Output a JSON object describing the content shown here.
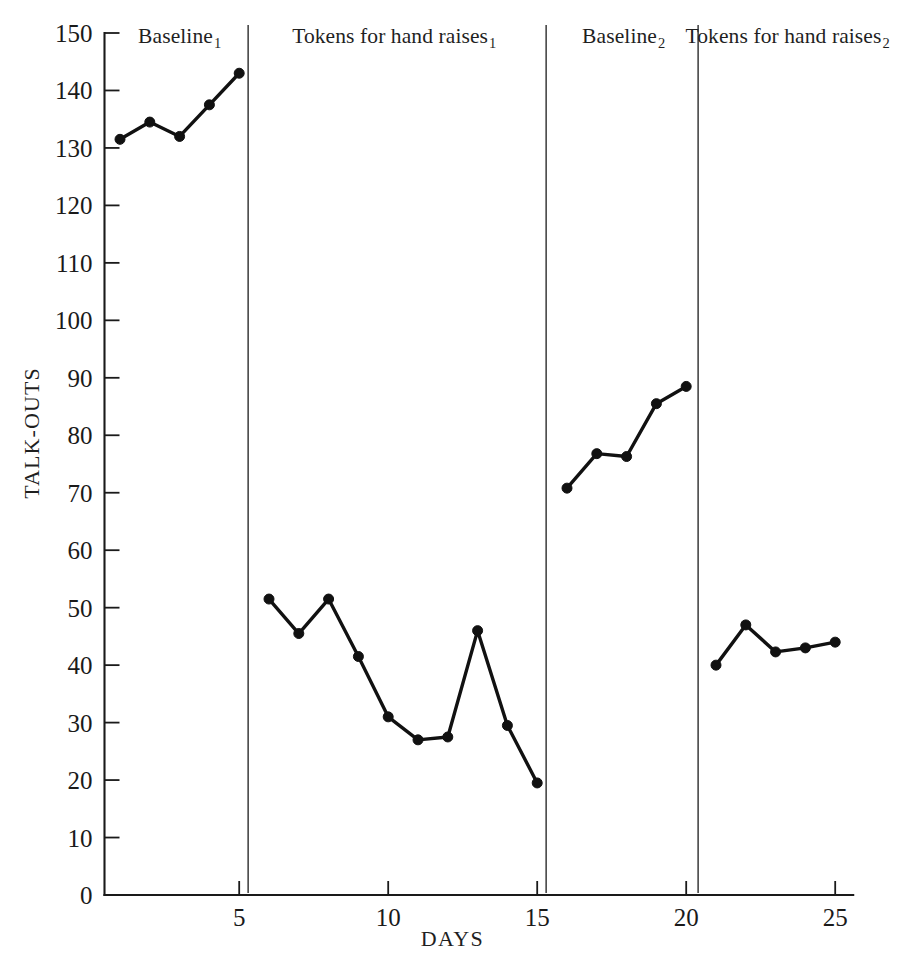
{
  "chart_data": {
    "type": "line",
    "title": "",
    "xlabel": "DAYS",
    "ylabel": "TALK-OUTS",
    "xlim": [
      0.3,
      25.8
    ],
    "ylim": [
      0,
      150
    ],
    "grid": false,
    "legend": "none",
    "y_ticks": [
      0,
      10,
      20,
      30,
      40,
      50,
      60,
      70,
      80,
      90,
      100,
      110,
      120,
      130,
      140,
      150
    ],
    "x_ticks": [
      5,
      10,
      15,
      20,
      25
    ],
    "x": [
      1,
      2,
      3,
      4,
      5,
      6,
      7,
      8,
      9,
      10,
      11,
      12,
      13,
      14,
      15,
      16,
      17,
      18,
      19,
      20,
      21,
      22,
      23,
      24,
      25
    ],
    "series": [
      {
        "name": "Baseline 1",
        "x": [
          1,
          2,
          3,
          4,
          5
        ],
        "values": [
          131.5,
          134.5,
          132.0,
          137.5,
          143.0
        ]
      },
      {
        "name": "Tokens for hand raises 1",
        "x": [
          6,
          7,
          8,
          9,
          10,
          11,
          12,
          13,
          14,
          15
        ],
        "values": [
          51.5,
          45.5,
          51.5,
          41.5,
          31.0,
          27.0,
          27.5,
          46.0,
          29.5,
          19.5
        ]
      },
      {
        "name": "Baseline 2",
        "x": [
          16,
          17,
          18,
          19,
          20
        ],
        "values": [
          70.8,
          76.8,
          76.3,
          85.5,
          88.5
        ]
      },
      {
        "name": "Tokens for hand raises 2",
        "x": [
          21,
          22,
          23,
          24,
          25
        ],
        "values": [
          40.0,
          47.0,
          42.3,
          43.0,
          44.0
        ]
      }
    ],
    "phases": [
      {
        "label": "Baseline",
        "subscript": "1",
        "start_day": 1,
        "end_day": 5.3,
        "label_center_day": 3.0
      },
      {
        "label": "Tokens for hand raises",
        "subscript": "1",
        "start_day": 5.3,
        "end_day": 15.3,
        "label_center_day": 10.2
      },
      {
        "label": "Baseline",
        "subscript": "2",
        "start_day": 15.3,
        "end_day": 20.4,
        "label_center_day": 17.9
      },
      {
        "label": "Tokens for hand raises",
        "subscript": "2",
        "start_day": 20.4,
        "end_day": 25.8,
        "label_center_day": 23.4
      }
    ],
    "phase_divider_days": [
      5.3,
      15.3,
      20.4
    ],
    "colors": {
      "line": "#111111",
      "marker": "#111111",
      "axis": "#1a1a1a",
      "divider": "#3a3a3a",
      "background": "#ffffff"
    }
  }
}
